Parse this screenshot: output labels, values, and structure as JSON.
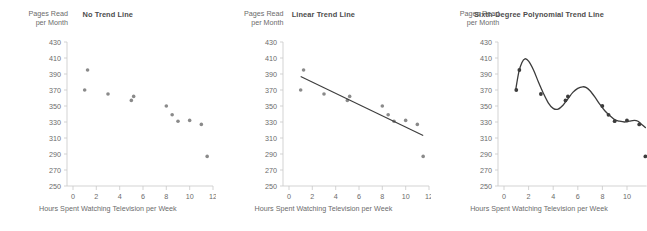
{
  "figure": {
    "panel_count": 3,
    "marker_color": "#8a8a8a",
    "trend_color": "#3c3c3c",
    "axis_color": "#c8c8c8",
    "text_color": "#6b6b6b",
    "title_color": "#4d4d4d"
  },
  "chart_data": [
    {
      "type": "scatter",
      "title": "No Trend Line",
      "xlabel": "Hours Spent Watching Television per Week",
      "ylabel": "Pages Read\nper Month",
      "ylabel_line1": "Pages Read",
      "ylabel_line2": "per Month",
      "xlim": [
        0,
        12
      ],
      "ylim": [
        250,
        430
      ],
      "xticks": [
        0,
        2,
        4,
        6,
        8,
        10,
        12
      ],
      "xtick_labels": [
        "0",
        "2",
        "4",
        "6",
        "8",
        "10",
        "12"
      ],
      "yticks": [
        250,
        270,
        290,
        310,
        330,
        350,
        370,
        390,
        410,
        430
      ],
      "ytick_labels": [
        "250",
        "270",
        "290",
        "310",
        "330",
        "350",
        "370",
        "390",
        "410",
        "430"
      ],
      "grid": false,
      "legend": false,
      "x": [
        1.0,
        1.25,
        3.0,
        5.0,
        5.2,
        8.0,
        8.5,
        9.0,
        10.0,
        11.0,
        11.5
      ],
      "y": [
        370,
        395,
        365,
        357,
        362,
        350,
        339,
        331,
        332,
        327,
        287
      ],
      "trendline": "none"
    },
    {
      "type": "scatter",
      "title": "Linear Trend Line",
      "xlabel": "Hours Spent Watching Television per Week",
      "ylabel": "Pages Read\nper Month",
      "ylabel_line1": "Pages Read",
      "ylabel_line2": "per Month",
      "xlim": [
        0,
        12
      ],
      "ylim": [
        250,
        430
      ],
      "xticks": [
        0,
        2,
        4,
        6,
        8,
        10,
        12
      ],
      "xtick_labels": [
        "0",
        "2",
        "4",
        "6",
        "8",
        "10",
        "12"
      ],
      "yticks": [
        250,
        270,
        290,
        310,
        330,
        350,
        370,
        390,
        410,
        430
      ],
      "ytick_labels": [
        "250",
        "270",
        "290",
        "310",
        "330",
        "350",
        "370",
        "390",
        "410",
        "430"
      ],
      "grid": false,
      "legend": false,
      "x": [
        1.0,
        1.25,
        3.0,
        5.0,
        5.2,
        8.0,
        8.5,
        9.0,
        10.0,
        11.0,
        11.5
      ],
      "y": [
        370,
        395,
        365,
        357,
        362,
        350,
        339,
        331,
        332,
        327,
        287
      ],
      "trendline": "linear",
      "trend_points": [
        [
          1.0,
          387
        ],
        [
          11.5,
          313
        ]
      ]
    },
    {
      "type": "scatter",
      "title": "Sixth-Degree Polynomial Trend Line",
      "xlabel": "Hours Spent Watching Television per Week",
      "ylabel": "Pages Read\nper Month",
      "ylabel_line1": "Pages Read",
      "ylabel_line2": "per Month",
      "xlim": [
        0,
        11.6
      ],
      "ylim": [
        250,
        430
      ],
      "xticks": [
        0,
        2,
        4,
        6,
        8,
        10
      ],
      "xtick_labels": [
        "0",
        "2",
        "4",
        "6",
        "8",
        "10"
      ],
      "yticks": [
        250,
        270,
        290,
        310,
        330,
        350,
        370,
        390,
        410,
        430
      ],
      "ytick_labels": [
        "250",
        "270",
        "290",
        "310",
        "330",
        "350",
        "370",
        "390",
        "410",
        "430"
      ],
      "grid": false,
      "legend": false,
      "x": [
        1.0,
        1.25,
        3.0,
        5.0,
        5.2,
        8.0,
        8.5,
        9.0,
        10.0,
        11.0,
        11.5
      ],
      "y": [
        370,
        395,
        365,
        357,
        362,
        350,
        339,
        331,
        332,
        327,
        287
      ],
      "trendline": "sixth-degree-polynomial",
      "trend_points": [
        [
          0.95,
          370
        ],
        [
          1.2,
          392
        ],
        [
          1.45,
          404
        ],
        [
          1.7,
          409
        ],
        [
          2.0,
          406
        ],
        [
          2.4,
          395
        ],
        [
          2.8,
          380
        ],
        [
          3.2,
          366
        ],
        [
          3.6,
          354
        ],
        [
          4.0,
          347
        ],
        [
          4.4,
          346
        ],
        [
          4.8,
          351
        ],
        [
          5.2,
          359
        ],
        [
          5.6,
          367
        ],
        [
          6.0,
          372
        ],
        [
          6.4,
          374
        ],
        [
          6.7,
          373
        ],
        [
          7.0,
          369
        ],
        [
          7.4,
          361
        ],
        [
          7.8,
          352
        ],
        [
          8.2,
          344
        ],
        [
          8.6,
          338
        ],
        [
          9.0,
          333
        ],
        [
          9.4,
          331
        ],
        [
          9.8,
          330
        ],
        [
          10.2,
          331
        ],
        [
          10.6,
          332
        ],
        [
          10.9,
          331
        ],
        [
          11.2,
          327
        ],
        [
          11.5,
          323
        ]
      ]
    }
  ]
}
